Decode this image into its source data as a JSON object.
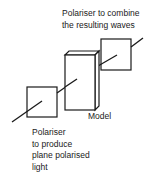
{
  "diagram": {
    "labels": {
      "top_polariser": [
        "Polariser to combine",
        "the resulting waves"
      ],
      "model": "Model",
      "bottom_polariser": [
        "Polariser",
        "to produce",
        "plane polarised",
        "light"
      ]
    },
    "colors": {
      "stroke": "#1a1a1a",
      "background": "#ffffff"
    }
  }
}
